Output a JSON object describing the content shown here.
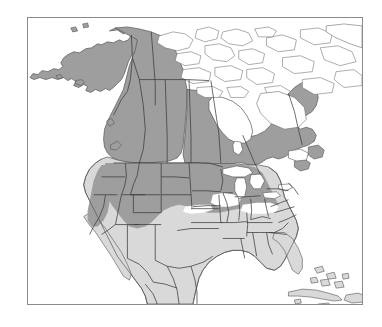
{
  "figure": {
    "kind": "distribution-range-map",
    "region": "North America",
    "title": "",
    "caption": "",
    "background_color": "#ffffff",
    "frame": {
      "visible": true,
      "color": "#8a8a8a",
      "width_px": 1.2,
      "x": 27,
      "y": 17,
      "w": 336,
      "h": 288
    }
  },
  "legend": {
    "visible": false,
    "entries": [
      {
        "key": "core-range",
        "label": "",
        "color": "#9e9e9e"
      },
      {
        "key": "secondary-range",
        "label": "",
        "color": "#d9d9d9"
      },
      {
        "key": "absent",
        "label": "",
        "color": "#ffffff"
      }
    ]
  },
  "map": {
    "viewbox": "0 0 336 288",
    "colors": {
      "core_range_fill": "#9e9e9e",
      "secondary_range_fill": "#d9d9d9",
      "absent_fill": "#ffffff",
      "coast_outline": "#555555",
      "admin_outline": "#3a3a3a",
      "frame": "#8a8a8a"
    },
    "line_widths": {
      "coastline": 0.7,
      "admin_boundary": 0.75,
      "island_outline": 0.6
    },
    "layers": [
      {
        "name": "arctic-archipelago",
        "shading": "absent"
      },
      {
        "name": "greenland-edge",
        "shading": "absent"
      },
      {
        "name": "hudson-bay",
        "shading": "absent"
      },
      {
        "name": "alaska",
        "shading": "core-range"
      },
      {
        "name": "western-canada",
        "shading": "core-range"
      },
      {
        "name": "eastern-canada",
        "shading": "core-range"
      },
      {
        "name": "northern-united-states",
        "shading": "core-range"
      },
      {
        "name": "southern-united-states",
        "shading": "secondary-range"
      },
      {
        "name": "mexico",
        "shading": "secondary-range"
      },
      {
        "name": "great-lakes",
        "shading": "absent"
      },
      {
        "name": "central-plains-gap",
        "shading": "absent"
      },
      {
        "name": "caribbean-islands",
        "shading": "secondary-range"
      },
      {
        "name": "bahamas-islands",
        "shading": "secondary-range"
      },
      {
        "name": "state-province-boundaries",
        "shading": "none"
      }
    ]
  },
  "chart_data": {
    "type": "map",
    "title": "",
    "xlabel": "",
    "ylabel": "",
    "projection": "equal-area-north-america",
    "categories": [
      "core-range",
      "secondary-range",
      "absent"
    ],
    "category_colors": [
      "#9e9e9e",
      "#d9d9d9",
      "#ffffff"
    ],
    "regions": [
      {
        "name": "Alaska",
        "category": "core-range"
      },
      {
        "name": "Yukon",
        "category": "core-range"
      },
      {
        "name": "Northwest Territories",
        "category": "core-range"
      },
      {
        "name": "British Columbia",
        "category": "core-range"
      },
      {
        "name": "Alberta",
        "category": "core-range"
      },
      {
        "name": "Saskatchewan",
        "category": "core-range"
      },
      {
        "name": "Manitoba",
        "category": "core-range"
      },
      {
        "name": "Ontario",
        "category": "core-range"
      },
      {
        "name": "Quebec",
        "category": "core-range"
      },
      {
        "name": "Labrador",
        "category": "core-range"
      },
      {
        "name": "Nunavut (Arctic islands)",
        "category": "absent"
      },
      {
        "name": "Greenland (edge)",
        "category": "absent"
      },
      {
        "name": "Hudson Bay",
        "category": "absent"
      },
      {
        "name": "Washington",
        "category": "core-range"
      },
      {
        "name": "Oregon",
        "category": "core-range"
      },
      {
        "name": "Idaho",
        "category": "core-range"
      },
      {
        "name": "Montana",
        "category": "core-range"
      },
      {
        "name": "Wyoming",
        "category": "core-range"
      },
      {
        "name": "North Dakota",
        "category": "core-range"
      },
      {
        "name": "South Dakota",
        "category": "core-range"
      },
      {
        "name": "Minnesota",
        "category": "core-range"
      },
      {
        "name": "Wisconsin",
        "category": "core-range"
      },
      {
        "name": "Michigan",
        "category": "core-range"
      },
      {
        "name": "New York",
        "category": "core-range"
      },
      {
        "name": "New England",
        "category": "core-range"
      },
      {
        "name": "Nevada",
        "category": "core-range"
      },
      {
        "name": "Utah",
        "category": "core-range"
      },
      {
        "name": "Colorado",
        "category": "core-range"
      },
      {
        "name": "California",
        "category": "secondary-range"
      },
      {
        "name": "Arizona",
        "category": "secondary-range"
      },
      {
        "name": "New Mexico",
        "category": "secondary-range"
      },
      {
        "name": "Nebraska",
        "category": "absent"
      },
      {
        "name": "Kansas",
        "category": "secondary-range"
      },
      {
        "name": "Texas",
        "category": "secondary-range"
      },
      {
        "name": "Oklahoma",
        "category": "secondary-range"
      },
      {
        "name": "Missouri",
        "category": "secondary-range"
      },
      {
        "name": "Arkansas",
        "category": "secondary-range"
      },
      {
        "name": "Louisiana",
        "category": "secondary-range"
      },
      {
        "name": "Mississippi",
        "category": "secondary-range"
      },
      {
        "name": "Alabama",
        "category": "secondary-range"
      },
      {
        "name": "Georgia",
        "category": "secondary-range"
      },
      {
        "name": "Florida",
        "category": "secondary-range"
      },
      {
        "name": "Carolinas",
        "category": "secondary-range"
      },
      {
        "name": "Virginia",
        "category": "secondary-range"
      },
      {
        "name": "Mexico",
        "category": "secondary-range"
      },
      {
        "name": "Cuba",
        "category": "secondary-range"
      },
      {
        "name": "Hispaniola",
        "category": "secondary-range"
      },
      {
        "name": "Puerto Rico",
        "category": "secondary-range"
      },
      {
        "name": "Bahamas",
        "category": "secondary-range"
      },
      {
        "name": "Great Lakes",
        "category": "absent"
      }
    ],
    "legend_position": "none",
    "grid": false
  }
}
